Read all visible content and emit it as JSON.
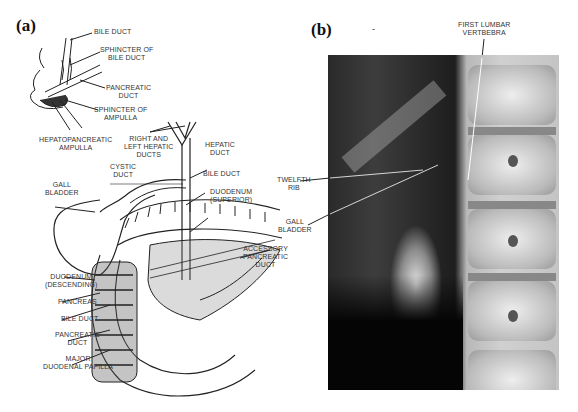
{
  "figure": {
    "panels": [
      {
        "id": "a",
        "label": "(a)",
        "type": "anatomical-line-drawing"
      },
      {
        "id": "b",
        "label": "(b)",
        "type": "radiograph"
      }
    ]
  },
  "panel_a": {
    "label": "(a)",
    "inset_labels": {
      "bile_duct": "BILE DUCT",
      "sphincter_bile_duct": [
        "SPHINCTER OF",
        "BILE DUCT"
      ],
      "pancreatic_duct": [
        "PANCREATIC",
        "DUCT"
      ],
      "sphincter_ampulla": [
        "SPHINCTER OF",
        "AMPULLA"
      ],
      "hepatopancreatic_ampulla": [
        "HEPATOPANCREATIC",
        "AMPULLA"
      ]
    },
    "main_labels": {
      "right_left_hepatic": [
        "RIGHT AND",
        "LEFT HEPATIC",
        "DUCTS"
      ],
      "hepatic_duct": [
        "HEPATIC",
        "DUCT"
      ],
      "cystic_duct": [
        "CYSTIC",
        "DUCT"
      ],
      "gall_bladder": [
        "GALL",
        "BLADDER"
      ],
      "bile_duct": "BILE DUCT",
      "duodenum_superior": [
        "DUODENUM",
        "(SUPERIOR)"
      ],
      "accessory_pancreatic_duct": [
        "ACCESSORY",
        "PANCREATIC",
        "DUCT"
      ],
      "duodenum_descending": [
        "DUODENUM",
        "(DESCENDING)"
      ],
      "pancreas": "PANCREAS",
      "bile_duct_lower": "BILE DUCT",
      "pancreatic_duct_lower": [
        "PANCREATIC",
        "DUCT"
      ],
      "major_duodenal_papilla": [
        "MAJOR",
        "DUODENAL PAPILLA"
      ]
    }
  },
  "panel_b": {
    "label": "(b)",
    "stray_mark": "-",
    "labels": {
      "first_lumbar": [
        "FIRST LUMBAR",
        "VERTBEBRA"
      ],
      "twelfth_rib": [
        "TWELFTH",
        "RIB"
      ],
      "gall_bladder": [
        "GALL",
        "BLADDER"
      ]
    }
  }
}
